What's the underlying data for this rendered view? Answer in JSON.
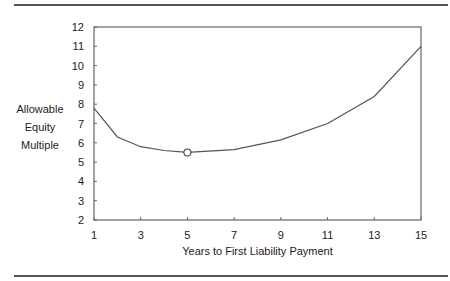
{
  "chart_data": {
    "type": "line",
    "title": "",
    "xlabel": "Years to First Liability Payment",
    "ylabel": "Allowable Equity Multiple",
    "ylabel_lines": [
      "Allowable",
      "Equity",
      "Multiple"
    ],
    "x": [
      1,
      2,
      3,
      4,
      5,
      7,
      9,
      11,
      13,
      15
    ],
    "series": [
      {
        "name": "Allowable Equity Multiple",
        "values": [
          7.8,
          6.3,
          5.8,
          5.6,
          5.5,
          5.65,
          6.15,
          7.0,
          8.4,
          11.0
        ]
      }
    ],
    "highlight_point": {
      "x": 5,
      "y": 5.5,
      "marker": "open-circle"
    },
    "xticks": [
      1,
      3,
      5,
      7,
      9,
      11,
      13,
      15
    ],
    "yticks": [
      2,
      3,
      4,
      5,
      6,
      7,
      8,
      9,
      10,
      11,
      12
    ],
    "xlim": [
      1,
      15
    ],
    "ylim": [
      2,
      12
    ],
    "grid": false,
    "legend": "none"
  },
  "colors": {
    "line": "#555555",
    "axis": "#666666",
    "text": "#222222"
  }
}
